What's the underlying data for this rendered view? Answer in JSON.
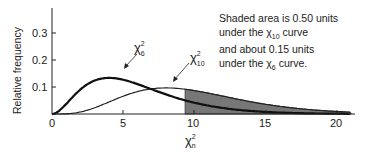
{
  "chart_data": {
    "type": "line",
    "title": "",
    "xlabel": "χ²_n",
    "ylabel": "Relative frequency",
    "xlim": [
      0,
      21
    ],
    "ylim": [
      0,
      0.35
    ],
    "x_ticks": [
      "0",
      "5",
      "10",
      "15",
      "20"
    ],
    "y_ticks": [
      "0.1",
      "0.2",
      "0.3"
    ],
    "grid": false,
    "series": [
      {
        "name": "χ²_6",
        "df": 6,
        "style": "thick",
        "peak_x": 4,
        "peak_y": 0.147
      },
      {
        "name": "χ²_10",
        "df": 10,
        "style": "thin",
        "peak_x": 8,
        "peak_y": 0.12
      }
    ],
    "shaded_region": {
      "x_from": 9.34,
      "x_to": 21,
      "under": "χ²_10"
    },
    "annotation": [
      "Shaded area is 0.50 units",
      "under the χ²₁₀ curve",
      "and about 0.15 units",
      "under the χ²₆ curve."
    ]
  },
  "labels": {
    "ylabel": "Relative frequency",
    "xlabel": "χ",
    "xlabel_sub": "n",
    "xlabel_sup": "2",
    "curve6": "χ",
    "curve6_sub": "6",
    "curve10": "χ",
    "curve10_sub": "10",
    "sup": "2",
    "y1": "0.1",
    "y2": "0.2",
    "y3": "0.3",
    "x0": "0",
    "x5": "5",
    "x10": "10",
    "x15": "15",
    "x20": "20"
  },
  "note": {
    "l1": "Shaded area is 0.50 units",
    "l2a": "under the χ",
    "l2sub": "10",
    "l2b": " curve",
    "l3": "and about 0.15 units",
    "l4a": "under the χ",
    "l4sub": "6",
    "l4b": " curve."
  }
}
